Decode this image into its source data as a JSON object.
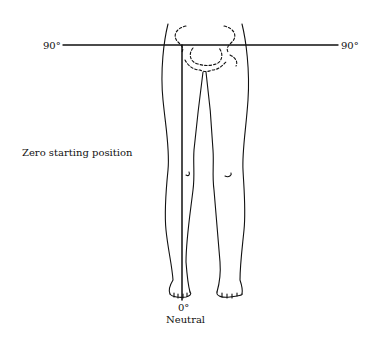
{
  "diagram": {
    "title_label": "Zero starting position",
    "left_angle": "90°",
    "right_angle": "90°",
    "bottom_angle": "0°",
    "bottom_caption": "Neutral",
    "line_color": "#111111"
  }
}
